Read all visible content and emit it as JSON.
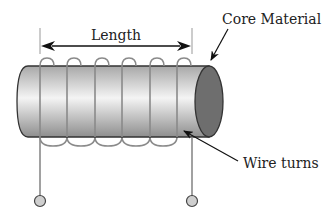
{
  "diagram": {
    "labels": {
      "length": "Length",
      "core": "Core Material",
      "wire": "Wire turns"
    },
    "turns": 6,
    "colors": {
      "wire": "#8a8a8a",
      "outline": "#333333",
      "core_face": "#6e6e6e",
      "body_light": "#f2f2f2",
      "body_dark": "#9c9c9c",
      "terminal": "#cfcfcf",
      "text": "#222222"
    }
  }
}
